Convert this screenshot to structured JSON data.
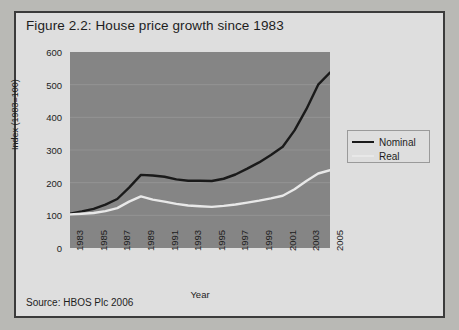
{
  "figure": {
    "title": "Figure 2.2: House price growth since 1983",
    "source": "Source: HBOS Plc 2006"
  },
  "legend": {
    "position": "right",
    "items": [
      {
        "label": "Nominal",
        "color": "#1a1a1a"
      },
      {
        "label": "Real",
        "color": "#e8e8e8"
      }
    ]
  },
  "colors": {
    "panel_background": "#dedede",
    "plot_background": "#858585",
    "border": "#3b3b3b",
    "gridline": "#9a9a9a",
    "nominal": "#1a1a1a",
    "real": "#e8e8e8",
    "text": "#1d1d1d"
  },
  "chart_data": {
    "type": "line",
    "title": "Figure 2.2: House price growth since 1983",
    "xlabel": "Year",
    "ylabel": "Index (1983=100)",
    "xlim": [
      1983,
      2005
    ],
    "ylim": [
      0,
      600
    ],
    "ytick_labels": [
      "600",
      "500",
      "400",
      "300",
      "200",
      "100",
      "0"
    ],
    "yticks": [
      600,
      500,
      400,
      300,
      200,
      100,
      0
    ],
    "xtick_labels": [
      "1983",
      "1985",
      "1987",
      "1989",
      "1991",
      "1993",
      "1995",
      "1997",
      "1999",
      "2001",
      "2003",
      "2005"
    ],
    "xticks": [
      1983,
      1985,
      1987,
      1989,
      1991,
      1993,
      1995,
      1997,
      1999,
      2001,
      2003,
      2005
    ],
    "grid": true,
    "grid_axis": "y",
    "x": [
      1983,
      1984,
      1985,
      1986,
      1987,
      1988,
      1989,
      1990,
      1991,
      1992,
      1993,
      1994,
      1995,
      1996,
      1997,
      1998,
      1999,
      2000,
      2001,
      2002,
      2003,
      2004,
      2005
    ],
    "series": [
      {
        "name": "Nominal",
        "color": "#1a1a1a",
        "values": [
          105,
          112,
          120,
          133,
          150,
          185,
          224,
          222,
          218,
          210,
          206,
          206,
          205,
          212,
          225,
          243,
          262,
          285,
          310,
          360,
          425,
          500,
          537
        ]
      },
      {
        "name": "Real",
        "color": "#e8e8e8",
        "values": [
          103,
          105,
          107,
          113,
          122,
          142,
          158,
          148,
          142,
          135,
          130,
          128,
          126,
          129,
          133,
          139,
          145,
          152,
          160,
          180,
          205,
          228,
          238
        ]
      }
    ]
  }
}
